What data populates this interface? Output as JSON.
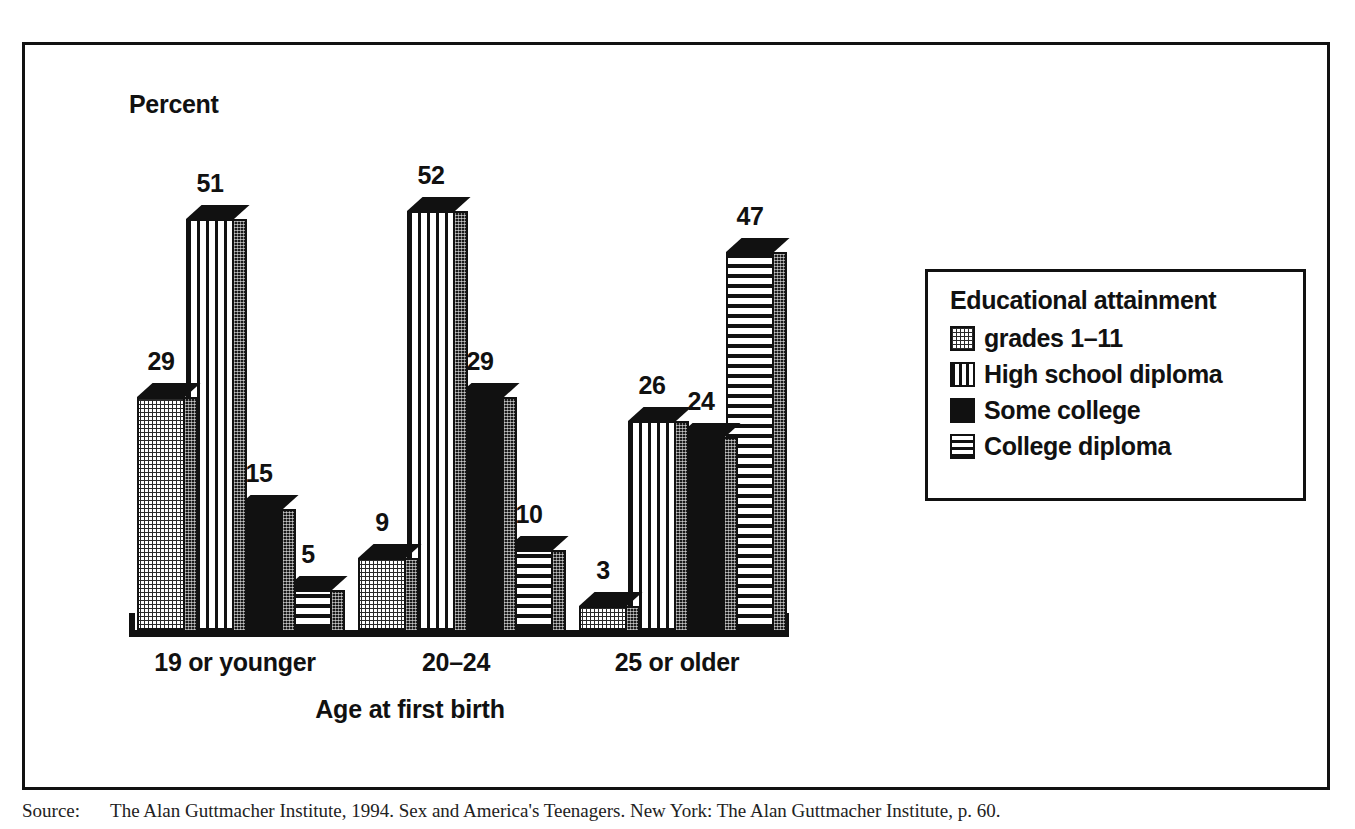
{
  "figure": {
    "y_axis_label": "Percent",
    "x_axis_title": "Age at first birth"
  },
  "legend": {
    "title": "Educational attainment",
    "entries": [
      {
        "label": "grades 1–11",
        "pattern": "dotted-stipple"
      },
      {
        "label": "High school diploma",
        "pattern": "vertical-stripes"
      },
      {
        "label": "Some college",
        "pattern": "solid-black"
      },
      {
        "label": "College diploma",
        "pattern": "horizontal-stripes"
      }
    ]
  },
  "caption": {
    "source_label": "Source:",
    "text": "The Alan Guttmacher Institute, 1994. Sex and America's Teenagers. New York: The Alan Guttmacher Institute, p. 60."
  },
  "chart_data": {
    "type": "bar",
    "title": "",
    "xlabel": "Age at first birth",
    "ylabel": "Percent",
    "ylim": [
      0,
      60
    ],
    "grid": false,
    "legend_position": "right",
    "legend_title": "Educational attainment",
    "categories": [
      "19 or younger",
      "20–24",
      "25 or older"
    ],
    "series": [
      {
        "name": "grades 1–11",
        "values": [
          29,
          9,
          3
        ]
      },
      {
        "name": "High school diploma",
        "values": [
          51,
          52,
          26
        ]
      },
      {
        "name": "Some college",
        "values": [
          15,
          29,
          24
        ]
      },
      {
        "name": "College diploma",
        "values": [
          5,
          10,
          47
        ]
      }
    ]
  }
}
